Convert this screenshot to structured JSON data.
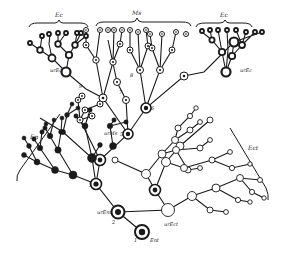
{
  "diagram": {
    "type": "cell-lineage-tree",
    "groups": [
      {
        "id": "Ec",
        "label": "Ec",
        "position": "top-left",
        "node_style": "bold-ring"
      },
      {
        "id": "Ms",
        "label": "Ms",
        "position": "top-center",
        "node_style": "dotted-ring"
      },
      {
        "id": "Ec2",
        "label": "Ec",
        "position": "top-right",
        "node_style": "bold-ring"
      },
      {
        "id": "En",
        "label": "En",
        "position": "left",
        "node_style": "filled"
      },
      {
        "id": "Ect",
        "label": "Ect",
        "position": "right",
        "node_style": "hollow"
      }
    ],
    "node_labels": [
      {
        "text": "urEc",
        "near": "top-left-branch-root"
      },
      {
        "text": "urEc",
        "near": "top-right-branch-root"
      },
      {
        "text": "urMs",
        "near": "center-stem"
      },
      {
        "text": "urEnt",
        "near": "lower-stem"
      },
      {
        "text": "urEct",
        "near": "right-branch-root"
      },
      {
        "text": "Ent",
        "near": "tree-root"
      }
    ],
    "generation_numbers": [
      "1",
      "2",
      "3",
      "4",
      "5",
      "6",
      "7",
      "8",
      "9"
    ],
    "colors": {
      "ink": "#1a1a1a",
      "background": "#ffffff"
    }
  }
}
